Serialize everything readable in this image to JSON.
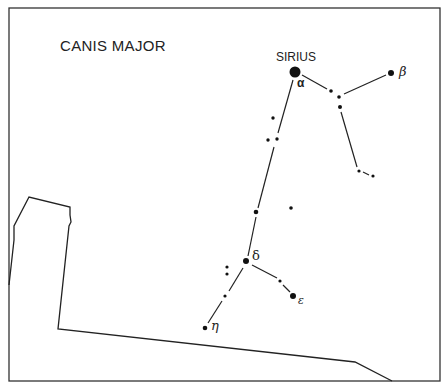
{
  "title": "CANIS MAJOR",
  "labels": {
    "sirius": "SIRIUS",
    "alpha": "α",
    "beta": "β",
    "delta": "δ",
    "epsilon": "ε",
    "eta": "η"
  },
  "colors": {
    "ink": "#222222",
    "background": "#ffffff"
  }
}
